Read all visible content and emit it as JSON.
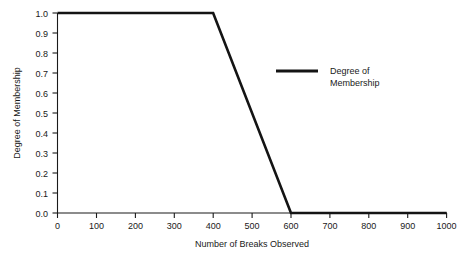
{
  "chart_data": {
    "type": "line",
    "title": "",
    "subtitle": "",
    "xlabel": "Number of Breaks Observed",
    "ylabel": "Degree of Membership",
    "xlim": [
      0,
      1000
    ],
    "ylim": [
      0.0,
      1.0
    ],
    "grid": false,
    "legend_position": "inside-upper-right",
    "x_ticks": [
      0,
      100,
      200,
      300,
      400,
      500,
      600,
      700,
      800,
      900,
      1000
    ],
    "x_tick_labels": [
      "0",
      "100",
      "200",
      "300",
      "400",
      "500",
      "600",
      "700",
      "800",
      "900",
      "1000"
    ],
    "y_ticks": [
      0.0,
      0.1,
      0.2,
      0.3,
      0.4,
      0.5,
      0.6,
      0.7,
      0.8,
      0.9,
      1.0
    ],
    "y_tick_labels": [
      "0.0",
      "0.1",
      "0.2",
      "0.3",
      "0.4",
      "0.5",
      "0.6",
      "0.7",
      "0.8",
      "0.9",
      "1.0"
    ],
    "series": [
      {
        "name": "Degree of Membership",
        "color": "#141414",
        "x": [
          0,
          400,
          600,
          1000
        ],
        "values": [
          1.0,
          1.0,
          0.0,
          0.0
        ]
      }
    ],
    "legend_entries": [
      {
        "label_line1": "Degree of",
        "label_line2": "Membership",
        "color": "#141414"
      }
    ],
    "annotations": []
  },
  "axes": {
    "x_axis_title": "Number of Breaks Observed",
    "y_axis_title": "Degree of Membership"
  },
  "colors": {
    "background": "#ffffff",
    "axis": "#1a1a1a",
    "series": "#141414",
    "text": "#1a1a1a"
  }
}
